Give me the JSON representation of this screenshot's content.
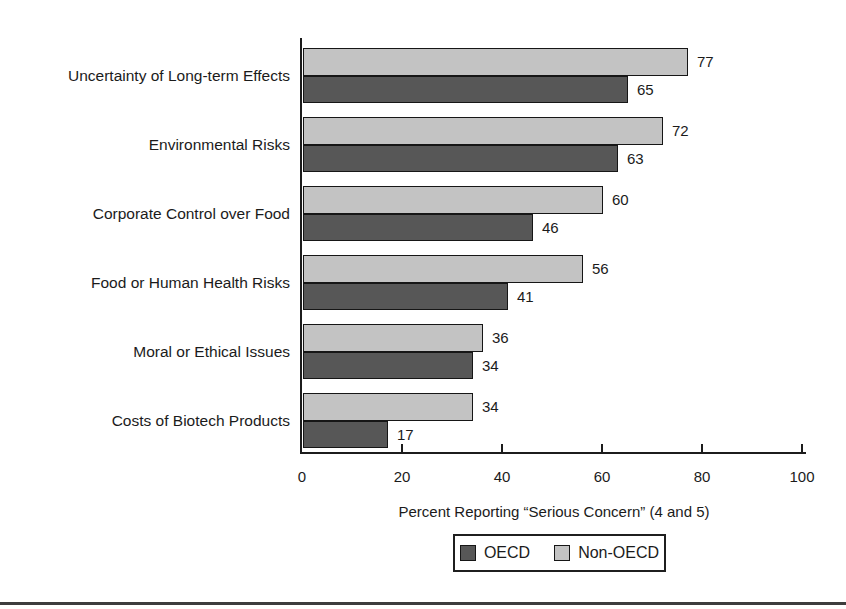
{
  "page": {
    "background": "#ffffff"
  },
  "chart_data": {
    "type": "bar",
    "orientation": "horizontal",
    "title": "",
    "xlabel": "Percent Reporting “Serious Concern” (4 and 5)",
    "xlim": [
      0,
      100
    ],
    "xticks": [
      0,
      20,
      40,
      60,
      80,
      100
    ],
    "grid": false,
    "value_labels_shown": true,
    "legend_position": "bottom-center",
    "bar_display_order_top_to_bottom": [
      "Non-OECD",
      "OECD"
    ],
    "categories": [
      "Uncertainty of Long-term Effects",
      "Environmental Risks",
      "Corporate Control over Food",
      "Food or Human Health Risks",
      "Moral or Ethical Issues",
      "Costs of Biotech Products"
    ],
    "series": [
      {
        "name": "OECD",
        "color": "#575757",
        "values": [
          65,
          63,
          46,
          41,
          34,
          17
        ]
      },
      {
        "name": "Non-OECD",
        "color": "#c3c3c3",
        "values": [
          77,
          72,
          60,
          56,
          36,
          34
        ]
      }
    ]
  },
  "legend": {
    "items": [
      {
        "label": "OECD",
        "color": "#575757"
      },
      {
        "label": "Non-OECD",
        "color": "#c3c3c3"
      }
    ]
  },
  "colors": {
    "axis": "#1c1c1c",
    "text": "#1b1b1b",
    "bar_border": "#161616",
    "legend_border": "#1f1f1f",
    "page_divider": "#3d3d3d"
  }
}
